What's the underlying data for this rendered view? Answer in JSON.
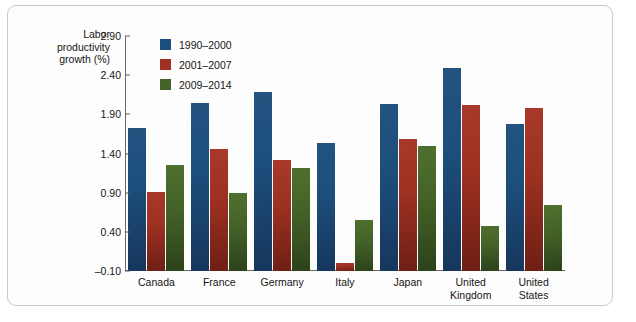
{
  "chart_data": {
    "type": "bar",
    "title": "",
    "xlabel": "",
    "ylabel": "Labor productivity growth (%)",
    "ylim": [
      -0.1,
      2.9
    ],
    "ytick_values": [
      2.9,
      2.4,
      1.9,
      1.4,
      0.9,
      0.4,
      -0.1
    ],
    "ytick_labels": [
      "2.90",
      "2.40",
      "1.90",
      "1.40",
      "0.90",
      "0.40",
      "–0.10"
    ],
    "grid": false,
    "legend_position": "top-left inside plot",
    "categories": [
      "Canada",
      "France",
      "Germany",
      "Italy",
      "Japan",
      "United Kingdom",
      "United States"
    ],
    "category_labels": [
      "Canada",
      "France",
      "Germany",
      "Italy",
      "Japan",
      "United\nKingdom",
      "United\nStates"
    ],
    "series": [
      {
        "name": "1990–2000",
        "color": "#1d4f7d",
        "values": [
          1.73,
          2.05,
          2.18,
          1.54,
          2.03,
          2.49,
          1.78
        ]
      },
      {
        "name": "2001–2007",
        "color": "#9e3122",
        "values": [
          0.91,
          1.46,
          1.32,
          0.0,
          1.58,
          2.02,
          1.98
        ]
      },
      {
        "name": "2009–2014",
        "color": "#456328",
        "values": [
          1.25,
          0.89,
          1.22,
          0.55,
          1.49,
          0.47,
          0.74
        ]
      }
    ]
  },
  "axis": {
    "y_title_line1": "Labor",
    "y_title_line2": "productivity",
    "y_title_line3": "growth (%)"
  }
}
